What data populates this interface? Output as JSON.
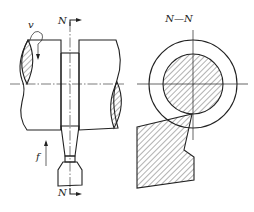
{
  "diagram": {
    "type": "technical-drawing",
    "left_view": {
      "name": "front-view",
      "labels": {
        "velocity": "v",
        "feed": "f",
        "section_top": "N",
        "section_bottom": "N"
      }
    },
    "right_view": {
      "name": "section-view",
      "title": "N—N"
    }
  }
}
